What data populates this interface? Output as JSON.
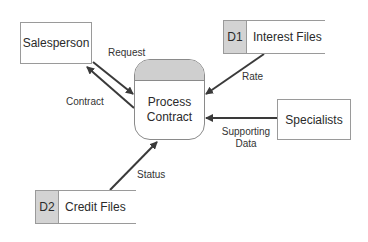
{
  "diagram": {
    "type": "data-flow-diagram",
    "process": {
      "lines": [
        "Process",
        "Contract"
      ]
    },
    "entities": [
      {
        "id": "salesperson",
        "label": "Salesperson"
      },
      {
        "id": "specialists",
        "label": "Specialists"
      }
    ],
    "data_stores": [
      {
        "id": "D1",
        "label": "Interest Files"
      },
      {
        "id": "D2",
        "label": "Credit Files"
      }
    ],
    "flows": [
      {
        "label": "Request",
        "from": "Salesperson",
        "to": "Process Contract"
      },
      {
        "label": "Contract",
        "from": "Process Contract",
        "to": "Salesperson"
      },
      {
        "label": "Rate",
        "from": "Interest Files",
        "to": "Process Contract"
      },
      {
        "label_lines": [
          "Supporting",
          "Data"
        ],
        "from": "Specialists",
        "to": "Process Contract"
      },
      {
        "label": "Status",
        "from": "Credit Files",
        "to": "Process Contract"
      }
    ],
    "colors": {
      "store_id_fill": "#d3d3d3",
      "process_header_fill": "#cfcfcf",
      "arrow": "#3a3a3a",
      "border": "#9a9a9a"
    }
  }
}
